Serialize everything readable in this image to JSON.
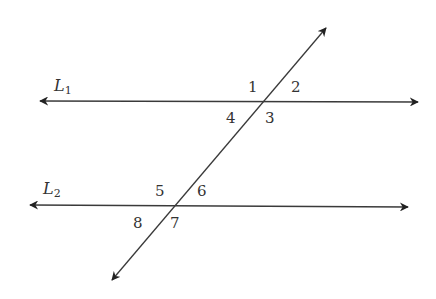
{
  "diagram": {
    "type": "parallel-lines-transversal",
    "lines": [
      {
        "name": "L",
        "subscript": "1",
        "y": 101,
        "x1": 40,
        "x2": 418
      },
      {
        "name": "L",
        "subscript": "2",
        "y": 206,
        "x1": 30,
        "x2": 408
      }
    ],
    "transversal": {
      "x1": 112,
      "y1": 280,
      "x2": 326,
      "y2": 28
    },
    "angles": [
      {
        "label": "1",
        "x": 248,
        "y": 78
      },
      {
        "label": "2",
        "x": 291,
        "y": 78
      },
      {
        "label": "3",
        "x": 265,
        "y": 110
      },
      {
        "label": "4",
        "x": 226,
        "y": 110
      },
      {
        "label": "5",
        "x": 155,
        "y": 183
      },
      {
        "label": "6",
        "x": 197,
        "y": 183
      },
      {
        "label": "7",
        "x": 170,
        "y": 215
      },
      {
        "label": "8",
        "x": 133,
        "y": 215
      }
    ],
    "stroke_color": "#3a3a3a"
  }
}
